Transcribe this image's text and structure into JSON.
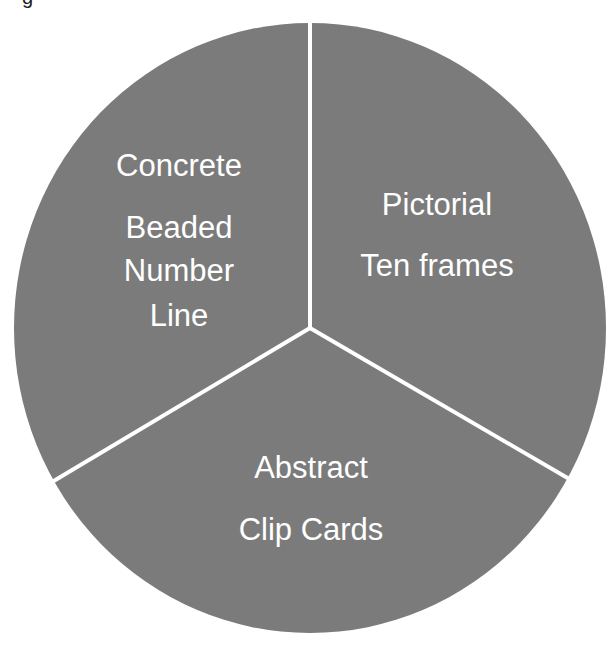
{
  "diagram": {
    "type": "pie-segmented-cycle",
    "fill_color": "#7b7b7b",
    "divider_color": "#ffffff",
    "background_color": "#ffffff",
    "text_color": "#ffffff",
    "top_fragment": "g",
    "segments": [
      {
        "id": "concrete",
        "title": "Concrete",
        "lines": [
          "Beaded",
          "Number",
          "Line"
        ]
      },
      {
        "id": "pictorial",
        "title": "Pictorial",
        "lines": [
          "Ten frames"
        ]
      },
      {
        "id": "abstract",
        "title": "Abstract",
        "lines": [
          "Clip Cards"
        ]
      }
    ]
  }
}
